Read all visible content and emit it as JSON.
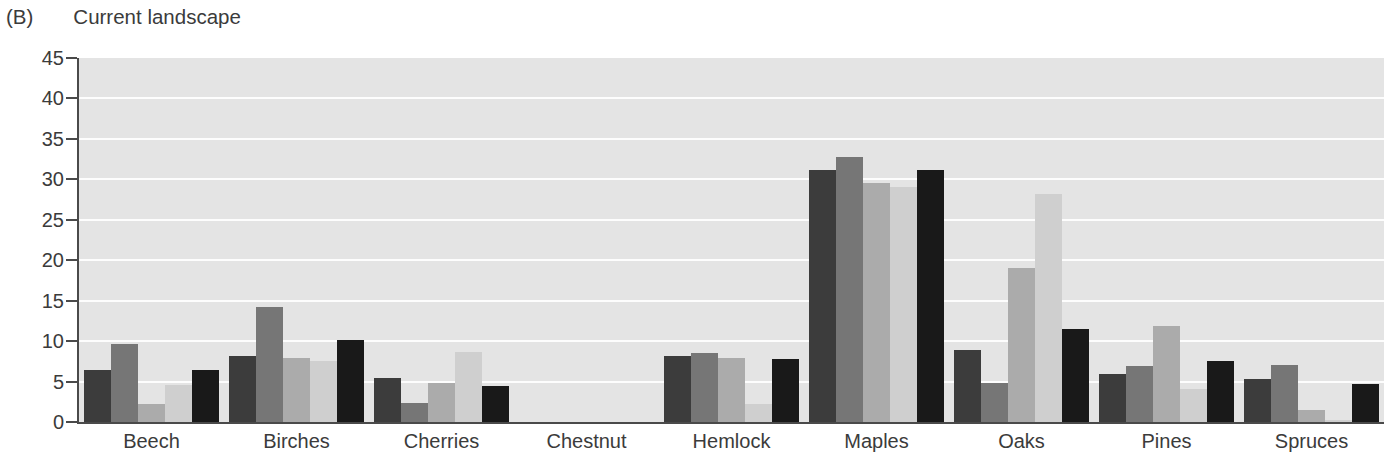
{
  "panel": {
    "letter": "(B)",
    "title": "Current landscape"
  },
  "axes": {
    "ylabel": "Relative abundance (%)",
    "yticks": [
      "0",
      "5",
      "10",
      "15",
      "20",
      "25",
      "30",
      "35",
      "40",
      "45"
    ]
  },
  "chart_data": {
    "type": "bar",
    "title": "Current landscape",
    "panel_label": "(B)",
    "xlabel": "",
    "ylabel": "Relative abundance (%)",
    "ylim": [
      0,
      45
    ],
    "ytick_step": 5,
    "grid": true,
    "grid_color": "#fdfdfd",
    "plot_background": "#e4e4e4",
    "legend": "none",
    "categories": [
      "Beech",
      "Birches",
      "Cherries",
      "Chestnut",
      "Hemlock",
      "Maples",
      "Oaks",
      "Pines",
      "Spruces"
    ],
    "series": [
      {
        "name": "series-1",
        "color": "#3c3c3c",
        "values": [
          6.4,
          8.2,
          5.4,
          0.0,
          8.1,
          31.2,
          8.9,
          5.9,
          5.3
        ]
      },
      {
        "name": "series-2",
        "color": "#767676",
        "values": [
          9.7,
          14.2,
          2.3,
          0.0,
          8.5,
          32.8,
          4.8,
          6.9,
          7.1
        ]
      },
      {
        "name": "series-3",
        "color": "#ababab",
        "values": [
          2.2,
          7.9,
          4.8,
          0.0,
          7.9,
          29.6,
          19.0,
          11.9,
          1.5
        ]
      },
      {
        "name": "series-4",
        "color": "#cfcfcf",
        "values": [
          4.6,
          7.6,
          8.6,
          0.0,
          2.2,
          29.0,
          28.2,
          4.1,
          0.3
        ]
      },
      {
        "name": "series-5",
        "color": "#191919",
        "values": [
          6.4,
          10.2,
          4.5,
          0.0,
          7.8,
          31.1,
          11.5,
          7.6,
          4.7
        ]
      }
    ]
  }
}
